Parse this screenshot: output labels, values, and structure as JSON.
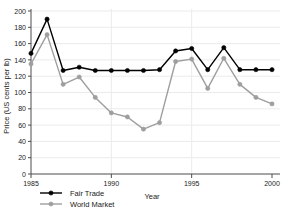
{
  "chart_data": {
    "type": "line",
    "title": "",
    "xlabel": "Year",
    "ylabel": "Price (US cents per lb)",
    "xlim": [
      1985,
      2000
    ],
    "ylim": [
      0,
      200
    ],
    "ytick_step": 20,
    "xtick_step": 5,
    "grid": true,
    "legend_position": "bottom-left",
    "x": [
      1985,
      1986,
      1987,
      1988,
      1989,
      1990,
      1991,
      1992,
      1993,
      1994,
      1995,
      1996,
      1997,
      1998,
      1999,
      2000
    ],
    "xticks": [
      "1985",
      "1990",
      "1995",
      "2000"
    ],
    "yticks": [
      "0",
      "20",
      "40",
      "60",
      "80",
      "100",
      "120",
      "140",
      "160",
      "180",
      "200"
    ],
    "series": [
      {
        "name": "Fair Trade",
        "color": "#000000",
        "marker": "circle",
        "values": [
          148,
          190,
          127,
          131,
          127,
          127,
          127,
          127,
          128,
          151,
          154,
          128,
          155,
          128,
          128,
          128
        ]
      },
      {
        "name": "World Market",
        "color": "#9e9e9e",
        "marker": "circle",
        "values": [
          135,
          171,
          110,
          119,
          94,
          75,
          70,
          55,
          63,
          138,
          141,
          105,
          142,
          110,
          94,
          86
        ]
      }
    ]
  },
  "legend": {
    "items": [
      {
        "label": "Fair Trade",
        "color": "#000000"
      },
      {
        "label": "World Market",
        "color": "#9e9e9e"
      }
    ]
  },
  "axes": {
    "x_title": "Year",
    "y_title": "Price (US cents per lb)"
  }
}
